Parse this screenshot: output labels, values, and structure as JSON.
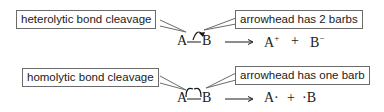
{
  "hetero": {
    "callout_left": "heterolytic bond cleavage",
    "callout_right": "arrowhead has 2 barbs",
    "reactant_a": "A",
    "reactant_b": "B",
    "product_1": "A",
    "product_1_charge": "+",
    "plus": "+",
    "product_2": "B",
    "product_2_charge": "−"
  },
  "homo": {
    "callout_left": "homolytic bond cleavage",
    "callout_right": "arrowhead has one barb",
    "reactant_a": "A",
    "reactant_b": "B",
    "product_1": "A·",
    "plus": "+",
    "product_2": "·B"
  }
}
